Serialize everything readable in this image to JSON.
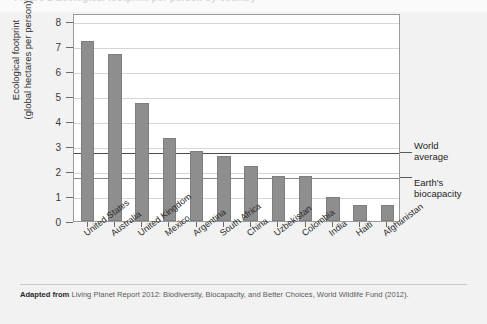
{
  "figure": {
    "top_partial_caption": "Figure 1  Ecological footprint per person by country",
    "background_color": "#f2f2f2",
    "bar_color": "#8e8e8e"
  },
  "caption": {
    "lead": "Adapted from",
    "text": "Living Planet Report 2012: Biodiversity, Biocapacity, and Better Choices, World Wildlife Fund (2012)."
  },
  "annotations": [
    {
      "line1": "World",
      "line2": "average",
      "value": 2.8
    },
    {
      "line1": "Earth's",
      "line2": "biocapacity",
      "value": 1.8
    }
  ],
  "chart_data": {
    "type": "bar",
    "title": "",
    "xlabel": "",
    "ylabel": "Ecological footprint (global hectares per person)",
    "ylabel_line1": "Ecological footprint",
    "ylabel_line2": "(global hectares per person)",
    "ylim": [
      0,
      8.3
    ],
    "yticks": [
      0,
      1,
      2,
      3,
      4,
      5,
      6,
      7,
      8
    ],
    "ytick_labels": [
      "0",
      "1",
      "2",
      "3",
      "4",
      "5",
      "6",
      "7",
      "8"
    ],
    "grid": true,
    "legend": "none",
    "categories": [
      "United States",
      "Australia",
      "United Kingdom",
      "Mexico",
      "Argentina",
      "South Africa",
      "China",
      "Uzbekistan",
      "Colombia",
      "India",
      "Haiti",
      "Afghanistan"
    ],
    "values": [
      7.2,
      6.65,
      4.7,
      3.3,
      2.8,
      2.6,
      2.2,
      1.8,
      1.8,
      0.95,
      0.65,
      0.62
    ],
    "reference_lines": [
      {
        "label": "World average",
        "value": 2.8
      },
      {
        "label": "Earth's biocapacity",
        "value": 1.8
      }
    ]
  }
}
